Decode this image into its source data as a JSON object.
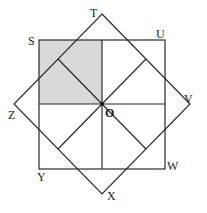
{
  "diagram": {
    "colors": {
      "stroke": "#2a2a2a",
      "shade": "#d9d9d9",
      "background": "#ffffff"
    },
    "labels": {
      "S": "S",
      "T": "T",
      "U": "U",
      "V": "V",
      "W": "W",
      "X": "X",
      "Y": "Y",
      "Z": "Z",
      "O": "O"
    }
  }
}
